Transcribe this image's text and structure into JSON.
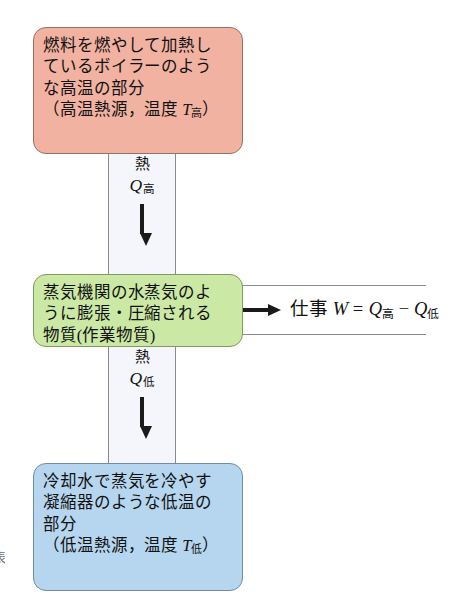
{
  "diagram": {
    "type": "heat-engine-energy-flow",
    "background_color": "#ffffff",
    "hot_reservoir": {
      "fill_color": "#f2b2a2",
      "lines": [
        "燃料を燃やして加熱し",
        "ているボイラーのよう",
        "な高温の部分"
      ],
      "paren_prefix": "（高温熱源，温度 ",
      "symbol": "T",
      "subscript": "高",
      "paren_suffix": "）"
    },
    "working_substance": {
      "fill_color": "#cbe8a5",
      "lines": [
        "蒸気機関の水蒸気のよ",
        "うに膨張・圧縮される",
        "物質(作業物質)"
      ]
    },
    "cold_reservoir": {
      "fill_color": "#b6d6ef",
      "lines": [
        "冷却水で蒸気を冷やす",
        "凝縮器のような低温の",
        "部分"
      ],
      "paren_prefix": "（低温熱源，温度 ",
      "symbol": "T",
      "subscript": "低",
      "paren_suffix": "）"
    },
    "heat_in": {
      "label": "熱",
      "symbol": "Q",
      "subscript": "高",
      "direction": "down",
      "channel_fill": "#f4f6fb"
    },
    "heat_out": {
      "label": "熱",
      "symbol": "Q",
      "subscript": "低",
      "direction": "down",
      "channel_fill": "#f4f6fb"
    },
    "work_output": {
      "direction": "right",
      "label": "仕事",
      "symbol": "W",
      "equals": "=",
      "term1_symbol": "Q",
      "term1_sub": "高",
      "minus": "−",
      "term2_symbol": "Q",
      "term2_sub": "低"
    },
    "margin_caption": "表"
  }
}
